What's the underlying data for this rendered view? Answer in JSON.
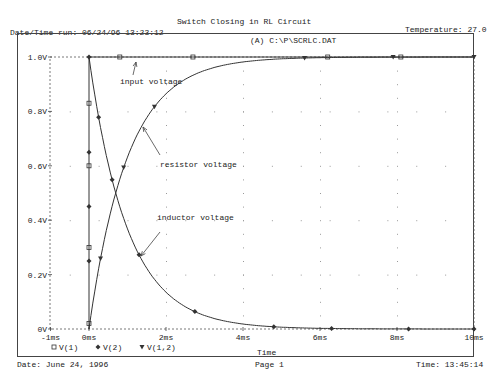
{
  "header": {
    "run_datetime": "Date/Time run: 06/24/96 13:23:12",
    "temperature": "Temperature: 27.0"
  },
  "footer": {
    "date": "Date: June 24, 1996",
    "page": "Page 1",
    "time": "Time: 13:45:14"
  },
  "chart_data": {
    "type": "line",
    "title": "Switch Closing in RL Circuit",
    "subtitle": "(A) C:\\P\\SCRLC.DAT",
    "xlabel": "Time",
    "ylabel": "",
    "xlim": [
      -1,
      10
    ],
    "ylim": [
      0,
      1.0
    ],
    "x_unit": "ms",
    "grid": "dotted",
    "x_ticks": [
      -1,
      0,
      2,
      4,
      6,
      8,
      10
    ],
    "x_tick_labels": [
      "-1ms",
      "0ms",
      "2ms",
      "4ms",
      "6ms",
      "8ms",
      "10ms"
    ],
    "y_ticks": [
      0,
      0.2,
      0.4,
      0.6,
      0.8,
      1.0
    ],
    "y_tick_labels": [
      "0V",
      "0.2V",
      "0.4V",
      "0.6V",
      "0.8V",
      "1.0V"
    ],
    "legend": {
      "placement": "bottom-left",
      "entries": [
        {
          "marker": "square",
          "label": "V(1)"
        },
        {
          "marker": "diamond",
          "label": "V(2)"
        },
        {
          "marker": "triangle",
          "label": "V(1,2)"
        }
      ]
    },
    "series": [
      {
        "name": "V(1)",
        "description": "input voltage",
        "marker": "square",
        "x": [
          0,
          0,
          0.8,
          2.7,
          6.2,
          8.1,
          10
        ],
        "y": [
          0,
          1.0,
          1.0,
          1.0,
          1.0,
          1.0,
          1.0
        ],
        "marker_x": [
          0,
          0,
          0,
          0,
          0.8,
          2.7,
          6.2,
          8.1
        ],
        "marker_y": [
          0.02,
          0.3,
          0.6,
          0.83,
          1.0,
          1.0,
          1.0,
          1.0
        ]
      },
      {
        "name": "V(2)",
        "description": "inductor voltage",
        "marker": "diamond",
        "tau": 1.0,
        "x": [
          0,
          0.3,
          0.5,
          1,
          1.3,
          2,
          3,
          4,
          4.8,
          6,
          8,
          10
        ],
        "y": [
          1.0,
          0.74,
          0.61,
          0.37,
          0.27,
          0.14,
          0.05,
          0.018,
          0.008,
          0.0025,
          0.0003,
          5e-05
        ]
      },
      {
        "name": "V(1,2)",
        "description": "resistor voltage",
        "marker": "triangle",
        "tau": 1.0,
        "x": [
          0,
          0.3,
          0.5,
          1,
          1.3,
          2,
          3,
          4,
          5,
          6,
          8,
          10
        ],
        "y": [
          0,
          0.26,
          0.39,
          0.63,
          0.73,
          0.86,
          0.95,
          0.982,
          0.993,
          0.9975,
          0.9997,
          1.0
        ]
      }
    ],
    "annotations": [
      {
        "text": "input voltage",
        "points_to": [
          0.8,
          1.0
        ]
      },
      {
        "text": "resistor voltage",
        "points_to": [
          1.3,
          0.73
        ]
      },
      {
        "text": "inductor voltage",
        "points_to": [
          1.3,
          0.27
        ]
      }
    ]
  }
}
